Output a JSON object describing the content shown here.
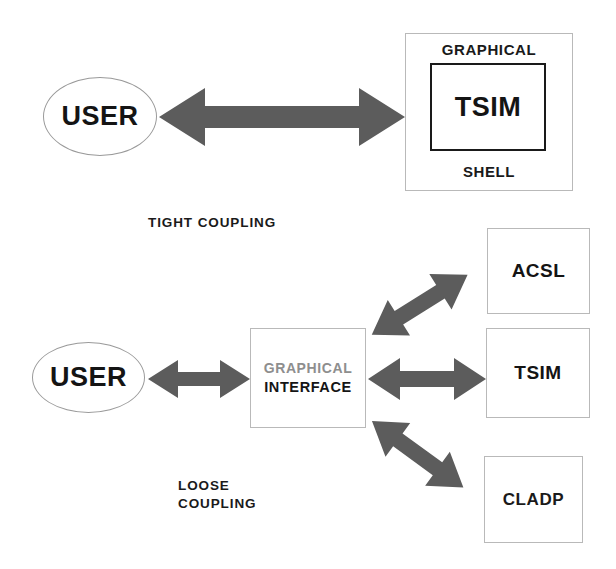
{
  "figure": {
    "title": "",
    "background_color": "#ffffff",
    "arrow_color": "#5c5c5c",
    "box_border_color": "#b9b9b9",
    "inner_box_border_color": "#1a1a1a",
    "text_color": "#141414",
    "muted_text_color": "#8e8e8e"
  },
  "tight_coupling": {
    "caption": "TIGHT COUPLING",
    "user_node": {
      "label": "USER",
      "shape": "ellipse"
    },
    "shell_box": {
      "top_label": "GRAPHICAL",
      "bottom_label": "SHELL",
      "inner_label": "TSIM"
    },
    "connector": {
      "label": "",
      "style": "double-headed-arrow"
    }
  },
  "loose_coupling": {
    "caption_line1": "LOOSE",
    "caption_line2": "COUPLING",
    "user_node": {
      "label": "USER",
      "shape": "ellipse"
    },
    "interface_box": {
      "line1": "GRAPHICAL",
      "line2": "INTERFACE"
    },
    "targets": [
      {
        "label": "ACSL"
      },
      {
        "label": "TSIM"
      },
      {
        "label": "CLADP"
      }
    ],
    "connectors": [
      {
        "from": "USER",
        "to": "GRAPHICAL INTERFACE",
        "style": "double-headed-arrow"
      },
      {
        "from": "GRAPHICAL INTERFACE",
        "to": "ACSL",
        "style": "double-headed-arrow"
      },
      {
        "from": "GRAPHICAL INTERFACE",
        "to": "TSIM",
        "style": "double-headed-arrow"
      },
      {
        "from": "GRAPHICAL INTERFACE",
        "to": "CLADP",
        "style": "double-headed-arrow"
      }
    ]
  }
}
